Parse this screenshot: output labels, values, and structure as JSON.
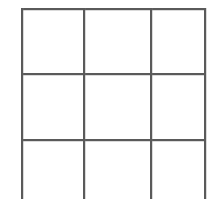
{
  "document": {
    "title": "Blank grid table",
    "background_color": "#ffffff",
    "line_color": "#5a5a5a"
  },
  "grid": {
    "name": "blank-3x3-table",
    "columns": 3,
    "rows": 3,
    "has_text": false,
    "bottom_row_clipped": true,
    "cells": [
      {
        "id": "r1c1",
        "text": ""
      },
      {
        "id": "r1c2",
        "text": ""
      },
      {
        "id": "r1c3",
        "text": ""
      },
      {
        "id": "r2c1",
        "text": ""
      },
      {
        "id": "r2c2",
        "text": ""
      },
      {
        "id": "r2c3",
        "text": ""
      },
      {
        "id": "r3c1",
        "text": ""
      },
      {
        "id": "r3c2",
        "text": ""
      },
      {
        "id": "r3c3",
        "text": ""
      }
    ]
  }
}
